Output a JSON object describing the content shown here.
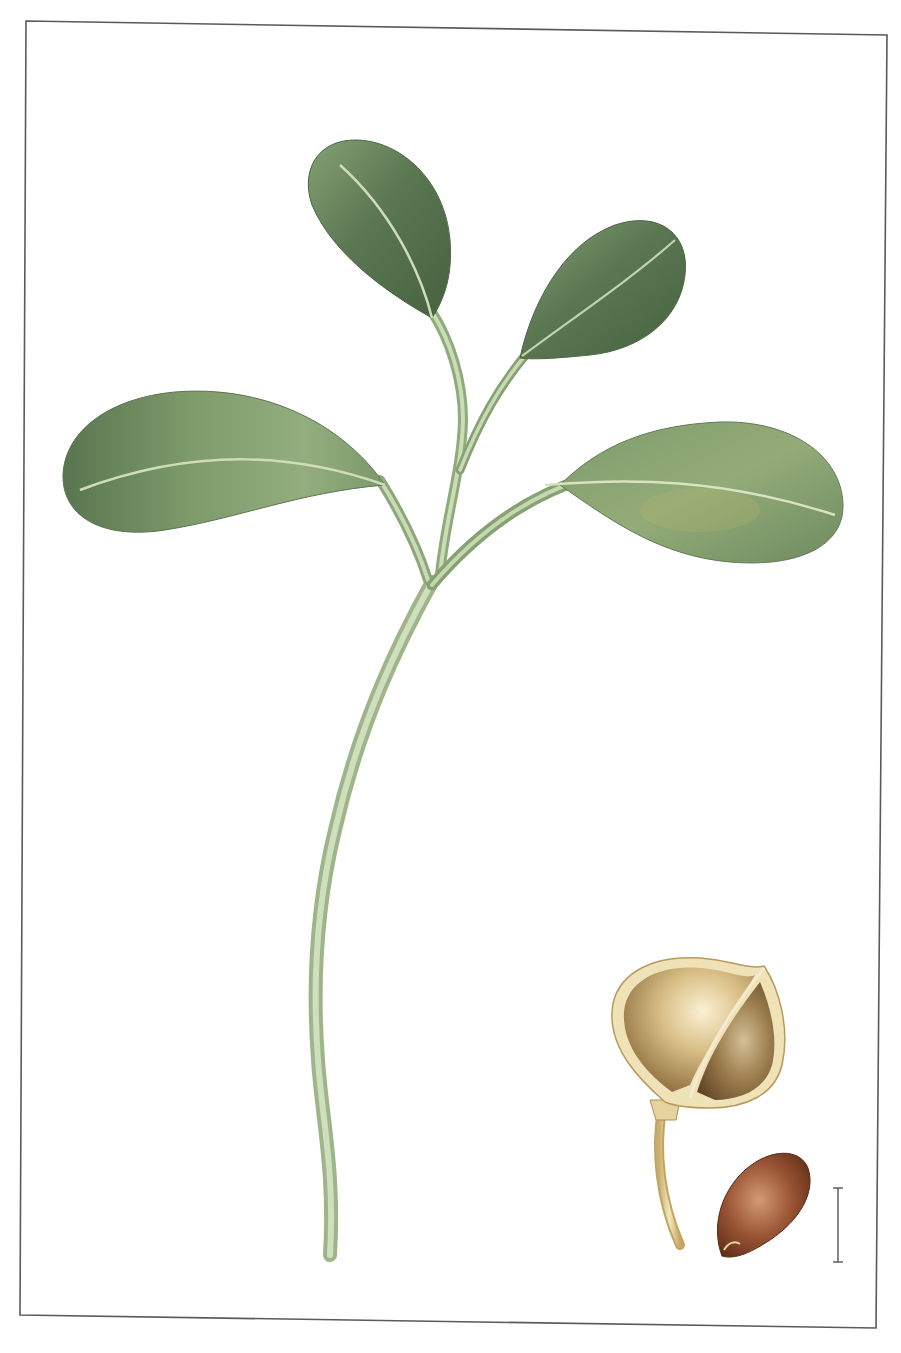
{
  "illustration": {
    "subject": "botanical illustration of a seedling with seed pod and seed",
    "background_color": "#ffffff",
    "frame": {
      "stroke_color": "#5a5a5a",
      "corners": {
        "top_left": [
          26,
          21
        ],
        "top_right": [
          887,
          35
        ],
        "bottom_right": [
          876,
          1328
        ],
        "bottom_left": [
          20,
          1315
        ]
      }
    },
    "colors": {
      "leaf_dark": "#4f6b48",
      "leaf_mid": "#7d9a6c",
      "leaf_light": "#a9c192",
      "midrib": "#cfdcb8",
      "stem_light": "#c4d6b0",
      "stem_dark": "#8ea67c",
      "pod_light": "#f2e3b8",
      "pod_mid": "#c9a96a",
      "pod_dark": "#7a5f36",
      "pod_rim": "#efe2b6",
      "seed_light": "#c58460",
      "seed_dark": "#5e2c15",
      "scale_bar": "#555555"
    },
    "parts": [
      {
        "name": "top-left-leaf"
      },
      {
        "name": "top-right-leaf"
      },
      {
        "name": "left-cotyledon"
      },
      {
        "name": "right-cotyledon"
      },
      {
        "name": "main-stem"
      },
      {
        "name": "seed-pod"
      },
      {
        "name": "seed"
      },
      {
        "name": "scale-bar"
      }
    ]
  }
}
